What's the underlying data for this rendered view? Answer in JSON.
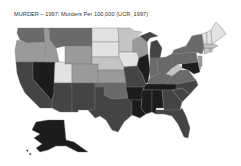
{
  "title": "MURDER – 1997: Murders Per 100,000 (UCR, 1997)",
  "map": {
    "type": "choropleth",
    "region": "United States",
    "metric": "Murders per 100,000",
    "source": "UCR, 1997",
    "shading": {
      "lightest": "#e2e2e2",
      "light": "#c4c4c4",
      "medium": "#9a9a9a",
      "dark": "#6a6a6a",
      "darker": "#444444",
      "darkest": "#1c1c1c"
    },
    "states": [
      {
        "id": "WA",
        "shade": "dark"
      },
      {
        "id": "OR",
        "shade": "medium"
      },
      {
        "id": "CA",
        "shade": "darker"
      },
      {
        "id": "NV",
        "shade": "darkest"
      },
      {
        "id": "ID",
        "shade": "medium"
      },
      {
        "id": "MT",
        "shade": "dark"
      },
      {
        "id": "WY",
        "shade": "medium"
      },
      {
        "id": "UT",
        "shade": "lightest"
      },
      {
        "id": "CO",
        "shade": "medium"
      },
      {
        "id": "AZ",
        "shade": "darker"
      },
      {
        "id": "NM",
        "shade": "darker"
      },
      {
        "id": "ND",
        "shade": "lightest"
      },
      {
        "id": "SD",
        "shade": "lightest"
      },
      {
        "id": "NE",
        "shade": "light"
      },
      {
        "id": "KS",
        "shade": "medium"
      },
      {
        "id": "OK",
        "shade": "dark"
      },
      {
        "id": "TX",
        "shade": "darker"
      },
      {
        "id": "MN",
        "shade": "light"
      },
      {
        "id": "IA",
        "shade": "lightest"
      },
      {
        "id": "MO",
        "shade": "darker"
      },
      {
        "id": "AR",
        "shade": "darkest"
      },
      {
        "id": "LA",
        "shade": "darkest"
      },
      {
        "id": "WI",
        "shade": "medium"
      },
      {
        "id": "IL",
        "shade": "darkest"
      },
      {
        "id": "MI",
        "shade": "darker"
      },
      {
        "id": "IN",
        "shade": "dark"
      },
      {
        "id": "OH",
        "shade": "dark"
      },
      {
        "id": "KY",
        "shade": "dark"
      },
      {
        "id": "TN",
        "shade": "darkest"
      },
      {
        "id": "MS",
        "shade": "darkest"
      },
      {
        "id": "AL",
        "shade": "darkest"
      },
      {
        "id": "GA",
        "shade": "darker"
      },
      {
        "id": "FL",
        "shade": "darker"
      },
      {
        "id": "SC",
        "shade": "darker"
      },
      {
        "id": "NC",
        "shade": "darker"
      },
      {
        "id": "VA",
        "shade": "dark"
      },
      {
        "id": "WV",
        "shade": "light"
      },
      {
        "id": "PA",
        "shade": "dark"
      },
      {
        "id": "NY",
        "shade": "dark"
      },
      {
        "id": "MD",
        "shade": "darkest"
      },
      {
        "id": "NJ",
        "shade": "medium"
      },
      {
        "id": "DE",
        "shade": "medium"
      },
      {
        "id": "CT",
        "shade": "light"
      },
      {
        "id": "RI",
        "shade": "light"
      },
      {
        "id": "MA",
        "shade": "light"
      },
      {
        "id": "VT",
        "shade": "lightest"
      },
      {
        "id": "NH",
        "shade": "lightest"
      },
      {
        "id": "ME",
        "shade": "lightest"
      },
      {
        "id": "AK",
        "shade": "darkest"
      }
    ]
  }
}
